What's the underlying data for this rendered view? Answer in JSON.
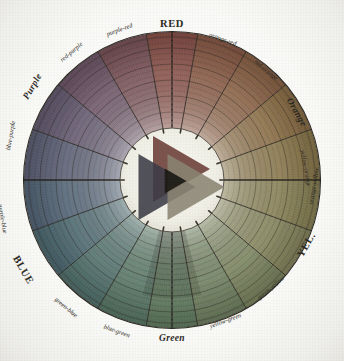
{
  "plate": {
    "title": "Prismatic Colour Wheel",
    "background_color": "#fafaf8",
    "ink_color": "#2b2822"
  },
  "wheel": {
    "center": {
      "x": 152,
      "y": 152
    },
    "outer_radius": 148,
    "hub_radius": 52,
    "ring_count": 18,
    "sector_count": 18,
    "hub_fill": "#f2f1ea",
    "hub_tick_count": 18
  },
  "hub": {
    "triangles": [
      {
        "name": "red-primary-triangle",
        "color": "#6a3b36",
        "position": "top"
      },
      {
        "name": "blue-primary-triangle",
        "color": "#3a3a46",
        "position": "lower-left"
      },
      {
        "name": "yellow-primary-triangle",
        "color": "#8a8472",
        "position": "lower-right"
      }
    ],
    "overlap_color": "#1a1814"
  },
  "chart_data": {
    "type": "pie",
    "legend": "none",
    "categories": [
      "RED",
      "orange-red",
      "red-orange",
      "Orange",
      "yellow-orange",
      "orange-yellow",
      "YEL.",
      "green-yellow",
      "yellow-green",
      "Green",
      "blue-green",
      "green-blue",
      "BLUE",
      "purple-blue",
      "blue-purple",
      "Purple",
      "red-purple",
      "purple-red"
    ],
    "values": [
      20,
      20,
      20,
      20,
      20,
      20,
      20,
      20,
      20,
      20,
      20,
      20,
      20,
      20,
      20,
      20,
      20,
      20
    ],
    "slice_colors": [
      "#8d5048",
      "#8e5a45",
      "#8f6244",
      "#907045",
      "#8f7b4b",
      "#8d8555",
      "#8a8a5f",
      "#7e8860",
      "#728562",
      "#628062",
      "#587a68",
      "#51736e",
      "#4c6b74",
      "#52657a",
      "#5c6079",
      "#665b74",
      "#70566a",
      "#7d5258"
    ]
  },
  "sectors": [
    {
      "index": 0,
      "label": "RED",
      "tier": "primary",
      "angle_deg": 0,
      "ring_tone": "#8d5048"
    },
    {
      "index": 1,
      "label": "orange-red",
      "tier": "tertiary",
      "angle_deg": 20,
      "ring_tone": "#8e5a45"
    },
    {
      "index": 2,
      "label": "red-orange",
      "tier": "tertiary",
      "angle_deg": 40,
      "ring_tone": "#8f6244"
    },
    {
      "index": 3,
      "label": "Orange",
      "tier": "secondary",
      "angle_deg": 60,
      "ring_tone": "#907045"
    },
    {
      "index": 4,
      "label": "yellow-orange",
      "tier": "tertiary",
      "angle_deg": 80,
      "ring_tone": "#8f7b4b"
    },
    {
      "index": 5,
      "label": "orange-yellow",
      "tier": "tertiary",
      "angle_deg": 100,
      "ring_tone": "#8d8555"
    },
    {
      "index": 6,
      "label": "YEL.",
      "tier": "primary",
      "angle_deg": 120,
      "ring_tone": "#8a8a5f"
    },
    {
      "index": 7,
      "label": "green-yellow",
      "tier": "tertiary",
      "angle_deg": 140,
      "ring_tone": "#7e8860"
    },
    {
      "index": 8,
      "label": "yellow-green",
      "tier": "tertiary",
      "angle_deg": 160,
      "ring_tone": "#728562"
    },
    {
      "index": 9,
      "label": "Green",
      "tier": "secondary",
      "angle_deg": 180,
      "ring_tone": "#628062"
    },
    {
      "index": 10,
      "label": "blue-green",
      "tier": "tertiary",
      "angle_deg": 200,
      "ring_tone": "#587a68"
    },
    {
      "index": 11,
      "label": "green-blue",
      "tier": "tertiary",
      "angle_deg": 220,
      "ring_tone": "#51736e"
    },
    {
      "index": 12,
      "label": "BLUE",
      "tier": "primary",
      "angle_deg": 240,
      "ring_tone": "#4c6b74"
    },
    {
      "index": 13,
      "label": "purple-blue",
      "tier": "tertiary",
      "angle_deg": 260,
      "ring_tone": "#52657a"
    },
    {
      "index": 14,
      "label": "blue-purple",
      "tier": "tertiary",
      "angle_deg": 280,
      "ring_tone": "#5c6079"
    },
    {
      "index": 15,
      "label": "Purple",
      "tier": "secondary",
      "angle_deg": 300,
      "ring_tone": "#665b74"
    },
    {
      "index": 16,
      "label": "red-purple",
      "tier": "tertiary",
      "angle_deg": 320,
      "ring_tone": "#70566a"
    },
    {
      "index": 17,
      "label": "purple-red",
      "tier": "tertiary",
      "angle_deg": 340,
      "ring_tone": "#7d5258"
    }
  ]
}
